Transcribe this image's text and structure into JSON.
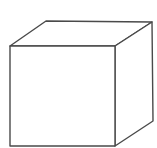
{
  "diagram": {
    "shape": "cube",
    "stroke_color": "#4a4a4a",
    "background": "#ffffff",
    "front_face": "10,46 115,46 115,146 10,146",
    "top_face": "10,46 46,21 152,22 115,46",
    "right_face": "115,46 152,22 153,121 115,146"
  }
}
